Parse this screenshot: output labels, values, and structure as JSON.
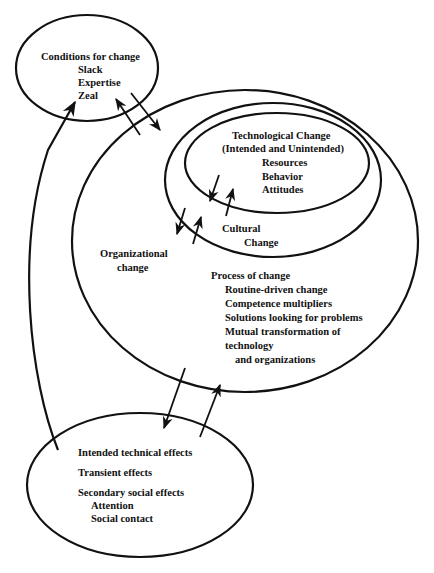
{
  "diagram": {
    "conditions": {
      "title": "Conditions for change",
      "items": [
        "Slack",
        "Expertise",
        "Zeal"
      ]
    },
    "technological": {
      "title": "Technological Change",
      "subtitle": "(Intended and Unintended)",
      "items": [
        "Resources",
        "Behavior",
        "Attitudes"
      ]
    },
    "cultural": {
      "line1": "Cultural",
      "line2": "Change"
    },
    "organizational": {
      "line1": "Organizational",
      "line2": "change"
    },
    "process": {
      "title": "Process of change",
      "items": [
        "Routine-driven change",
        "Competence multipliers",
        "Solutions looking for problems",
        "Mutual transformation of",
        "technology",
        "and organizations"
      ]
    },
    "effects": {
      "items": [
        "Intended technical effects",
        "Transient effects",
        "Secondary social effects"
      ],
      "sub_items": [
        "Attention",
        "Social contact"
      ]
    },
    "colors": {
      "stroke": "#111111",
      "background": "#ffffff"
    }
  }
}
